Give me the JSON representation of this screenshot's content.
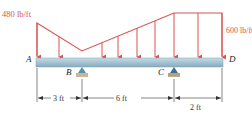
{
  "diagram": {
    "type": "beam-loading-diagram",
    "colors": {
      "load": "#d9534f",
      "beam_top": "#b9d3df",
      "beam_bottom": "#7fa6b8",
      "support_pin": "#5a8fb0",
      "support_base": "#c9b78e",
      "dimension": "#333333",
      "text": "#222222"
    },
    "loads": {
      "left_intensity": "480 lb/ft",
      "right_intensity": "600 lb/ft"
    },
    "points": {
      "A": "A",
      "B": "B",
      "C": "C",
      "D": "D"
    },
    "dimensions": {
      "AB": "3 ft",
      "BC": "6 ft",
      "CD": "2 ft"
    }
  }
}
